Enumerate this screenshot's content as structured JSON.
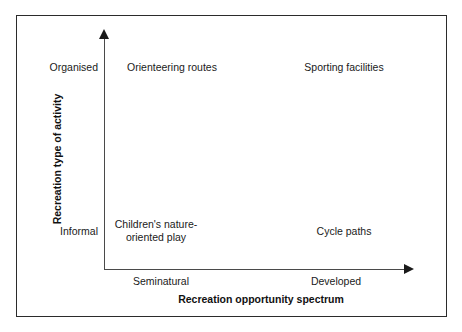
{
  "figure": {
    "type": "2x2-conceptual-quadrant-diagram",
    "axes": {
      "x": {
        "title": "Recreation opportunity spectrum",
        "low_label": "Seminatural",
        "high_label": "Developed",
        "arrow": "right-arrowhead"
      },
      "y": {
        "title": "Recreation type of activity",
        "low_label": "Informal",
        "high_label": "Organised",
        "arrow": "up-arrowhead"
      }
    },
    "quadrants": [
      {
        "position": "top-left",
        "x_level": "Seminatural",
        "y_level": "Organised",
        "label": "Orienteering routes"
      },
      {
        "position": "top-right",
        "x_level": "Developed",
        "y_level": "Organised",
        "label": "Sporting facilities"
      },
      {
        "position": "bottom-left",
        "x_level": "Seminatural",
        "y_level": "Informal",
        "label": "Children's nature-oriented play"
      },
      {
        "position": "bottom-right",
        "x_level": "Developed",
        "y_level": "Informal",
        "label": "Cycle paths"
      }
    ],
    "colors": {
      "frame_border": "#2b2b2b",
      "axis_line": "#4a4a4a",
      "arrowhead": "#1a1a1a",
      "text": "#1a1a1a",
      "background": "#ffffff"
    }
  }
}
